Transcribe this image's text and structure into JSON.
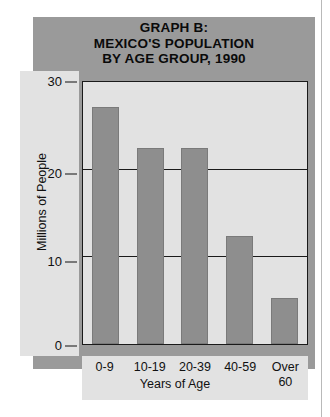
{
  "chart_data": {
    "type": "bar",
    "title": "GRAPH B: MEXICO'S POPULATION BY AGE GROUP, 1990",
    "title_lines": [
      "GRAPH B:",
      "MEXICO'S POPULATION",
      "BY AGE GROUP, 1990"
    ],
    "categories": [
      "0-9",
      "10-19",
      "20-39",
      "40-59",
      "Over 60"
    ],
    "category_lines": [
      [
        "0-9"
      ],
      [
        "10-19"
      ],
      [
        "20-39"
      ],
      [
        "40-59"
      ],
      [
        "Over",
        "60"
      ]
    ],
    "values": [
      27.2,
      22.5,
      22.5,
      12.4,
      5.3
    ],
    "xlabel": "Years of Age",
    "ylabel": "Millions of People",
    "ylim": [
      0,
      30
    ],
    "yticks": [
      0,
      10,
      20,
      30
    ],
    "ytick_labels": [
      "0",
      "10",
      "20",
      "30"
    ],
    "grid": "horizontal",
    "legend": "none",
    "colors": {
      "bar_fill": "#8e8e8e",
      "panel_background": "#9a9a9a",
      "plot_background": "#e2e2e2",
      "axis_line": "#1a1a1a",
      "text": "#111111",
      "page_background": "#ffffff"
    }
  }
}
